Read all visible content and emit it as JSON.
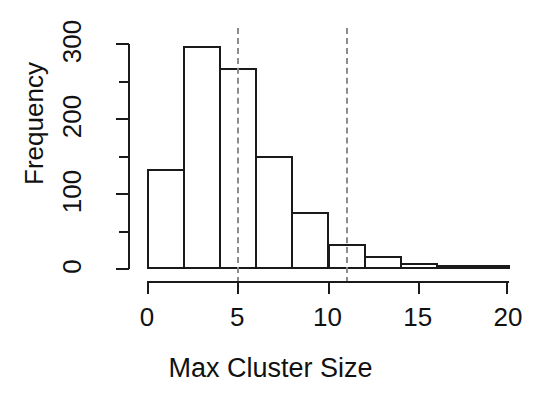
{
  "chart_data": {
    "type": "bar",
    "subtype": "histogram",
    "title": "",
    "xlabel": "Max Cluster Size",
    "ylabel": "Frequency",
    "xlim": [
      0,
      20
    ],
    "ylim": [
      0,
      300
    ],
    "grid": false,
    "legend": null,
    "bin_width": 2,
    "bin_edges": [
      0,
      2,
      4,
      6,
      8,
      10,
      12,
      14,
      16,
      18,
      20
    ],
    "categories": [
      "0-2",
      "2-4",
      "4-6",
      "6-8",
      "8-10",
      "10-12",
      "12-14",
      "14-16",
      "16-18",
      "18-20"
    ],
    "values": [
      133,
      297,
      268,
      151,
      76,
      34,
      17,
      8,
      4,
      1
    ],
    "x_ticks": [
      0,
      5,
      10,
      15,
      20
    ],
    "x_tick_labels": [
      "0",
      "5",
      "10",
      "15",
      "20"
    ],
    "y_ticks": [
      0,
      100,
      200,
      300
    ],
    "y_tick_labels": [
      "0",
      "100",
      "200",
      "300"
    ],
    "y_minor_ticks": [
      50,
      150,
      250
    ],
    "annotations": [
      {
        "name": "lower-reference-line",
        "type": "vline",
        "x": 5,
        "style": "dashed",
        "color": "#8c8c8c"
      },
      {
        "name": "upper-reference-line",
        "type": "vline",
        "x": 11,
        "style": "dashed",
        "color": "#8c8c8c"
      }
    ],
    "colors": {
      "bar_face": "#ffffff",
      "bar_edge": "#1a1a1a",
      "axis": "#1a1a1a",
      "text": "#111111",
      "reference_line": "#8c8c8c",
      "background": "#ffffff"
    }
  }
}
